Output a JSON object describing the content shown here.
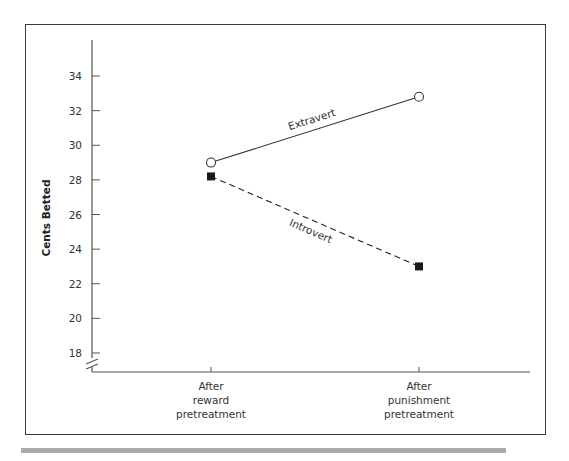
{
  "chart_data": {
    "type": "line",
    "title": "",
    "xlabel": "",
    "ylabel": "Cents Betted",
    "categories": [
      "After reward pretreatment",
      "After punishment pretreatment"
    ],
    "category_lines": [
      [
        "After",
        "reward",
        "pretreatment"
      ],
      [
        "After",
        "punishment",
        "pretreatment"
      ]
    ],
    "yticks": [
      18,
      20,
      22,
      24,
      26,
      28,
      30,
      32,
      34
    ],
    "ylim": [
      17,
      36
    ],
    "y_axis_break": true,
    "grid": false,
    "legend": "inline labels on lines",
    "series": [
      {
        "name": "Extravert",
        "values": [
          29.0,
          32.8
        ],
        "marker": "open-circle",
        "line": "solid",
        "color": "#333333"
      },
      {
        "name": "Introvert",
        "values": [
          28.2,
          23.0
        ],
        "marker": "filled-square",
        "line": "dashed",
        "color": "#222222"
      }
    ]
  }
}
